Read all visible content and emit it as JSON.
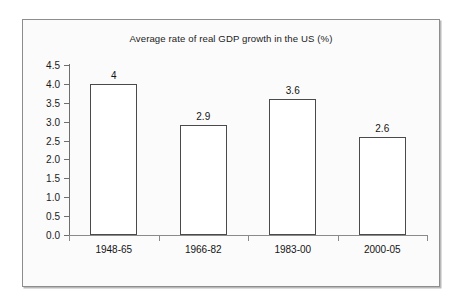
{
  "chart_data": {
    "type": "bar",
    "title": "Average rate of real GDP growth in the US (%)",
    "xlabel": "",
    "ylabel": "",
    "categories": [
      "1948-65",
      "1966-82",
      "1983-00",
      "2000-05"
    ],
    "values": [
      4,
      2.9,
      3.6,
      2.6
    ],
    "value_labels": [
      "4",
      "2.9",
      "3.6",
      "2.6"
    ],
    "ylim": [
      0,
      4.5
    ],
    "ytick_step": 0.5,
    "ytick_labels": [
      "0.0",
      "0.5",
      "1.0",
      "1.5",
      "2.0",
      "2.5",
      "3.0",
      "3.5",
      "4.0",
      "4.5"
    ],
    "ytick_values": [
      0,
      0.5,
      1,
      1.5,
      2,
      2.5,
      3,
      3.5,
      4,
      4.5
    ],
    "grid": false,
    "legend": null,
    "legend_position": "none",
    "colors": {
      "bar_fill": "#ffffff",
      "bar_edge": "#4a4a4a",
      "axis": "#6e6e6e",
      "text": "#141414",
      "frame_border": "#8d8d8d",
      "plot_background": "#fbfbfb",
      "page_background": "#ffffff"
    }
  }
}
